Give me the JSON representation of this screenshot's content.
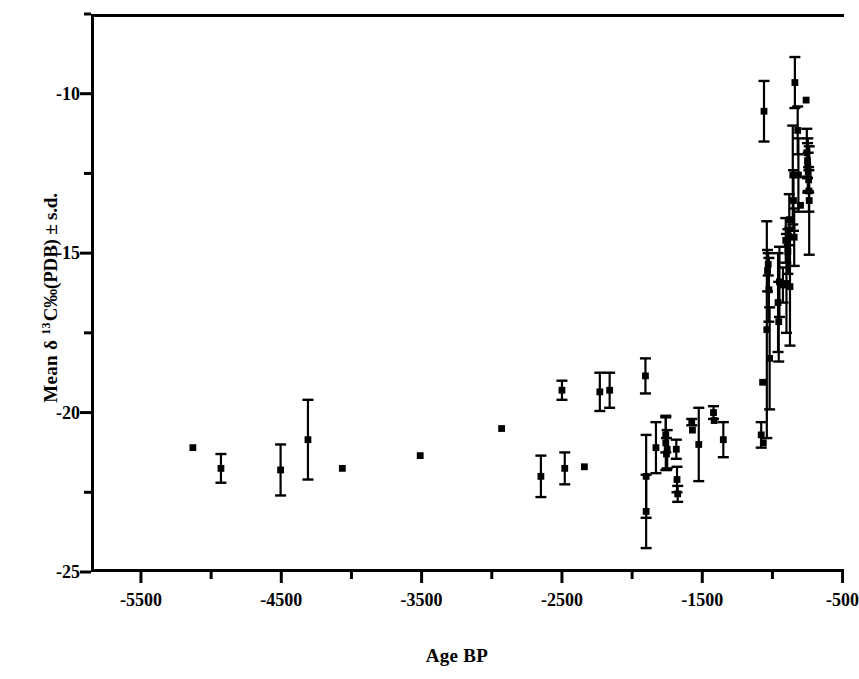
{
  "chart_data": {
    "type": "scatter",
    "title": "",
    "xlabel": "Age BP",
    "ylabel": "Mean δ 13C‰(PDB) ± s.d.",
    "ylabel_parts": {
      "prefix": "Mean δ ",
      "superscript": "13",
      "suffix": "C‰(PDB) ± s.d."
    },
    "xlim": [
      -5856,
      -490
    ],
    "ylim": [
      -25,
      -7.5
    ],
    "grid": false,
    "legend": null,
    "marker": "filled-square",
    "errorbars": "vertical ± s.d. with end caps",
    "color": "#000000",
    "xticks_major": [
      -5500,
      -4500,
      -3500,
      -2500,
      -1500,
      -500
    ],
    "xticks_major_labels": [
      "-5500",
      "-4500",
      "-3500",
      "-2500",
      "-1500",
      "-500"
    ],
    "xticks_minor": [
      -5000,
      -4000,
      -3000,
      -2000,
      -1000
    ],
    "yticks_major": [
      -10,
      -15,
      -20,
      -25
    ],
    "yticks_major_labels": [
      "-10",
      "-15",
      "-20",
      "-25"
    ],
    "yticks_minor": [
      -7.5,
      -12.5,
      -17.5,
      -22.5
    ],
    "series": [
      {
        "name": "Mean d13C by age",
        "points": [
          {
            "x": -5130,
            "y": -21.1,
            "sd": 0.0
          },
          {
            "x": -4930,
            "y": -21.75,
            "sd": 0.45
          },
          {
            "x": -4505,
            "y": -21.8,
            "sd": 0.8
          },
          {
            "x": -4310,
            "y": -20.85,
            "sd": 1.25
          },
          {
            "x": -4065,
            "y": -21.75,
            "sd": 0.0
          },
          {
            "x": -3510,
            "y": -21.35,
            "sd": 0.0
          },
          {
            "x": -2930,
            "y": -20.5,
            "sd": 0.0
          },
          {
            "x": -2650,
            "y": -22.0,
            "sd": 0.65
          },
          {
            "x": -2500,
            "y": -19.3,
            "sd": 0.3
          },
          {
            "x": -2480,
            "y": -21.75,
            "sd": 0.5
          },
          {
            "x": -2340,
            "y": -21.7,
            "sd": 0.0
          },
          {
            "x": -2230,
            "y": -19.35,
            "sd": 0.6
          },
          {
            "x": -2160,
            "y": -19.3,
            "sd": 0.55
          },
          {
            "x": -1905,
            "y": -18.85,
            "sd": 0.55
          },
          {
            "x": -1900,
            "y": -22.0,
            "sd": 1.3
          },
          {
            "x": -1900,
            "y": -23.1,
            "sd": 1.15
          },
          {
            "x": -1830,
            "y": -21.1,
            "sd": 0.8
          },
          {
            "x": -1760,
            "y": -20.95,
            "sd": 0.85
          },
          {
            "x": -1760,
            "y": -20.7,
            "sd": 0.55
          },
          {
            "x": -1755,
            "y": -21.3,
            "sd": 0.5
          },
          {
            "x": -1750,
            "y": -21.15,
            "sd": 0.6
          },
          {
            "x": -1685,
            "y": -21.15,
            "sd": 0.3
          },
          {
            "x": -1680,
            "y": -22.1,
            "sd": 0.4
          },
          {
            "x": -1675,
            "y": -22.55,
            "sd": 0.25
          },
          {
            "x": -1575,
            "y": -20.3,
            "sd": 0.1
          },
          {
            "x": -1570,
            "y": -20.55,
            "sd": 0.0
          },
          {
            "x": -1525,
            "y": -21.0,
            "sd": 1.15
          },
          {
            "x": -1420,
            "y": -20.0,
            "sd": 0.2
          },
          {
            "x": -1415,
            "y": -20.25,
            "sd": 0.0
          },
          {
            "x": -1350,
            "y": -20.85,
            "sd": 0.55
          },
          {
            "x": -1080,
            "y": -20.7,
            "sd": 0.4
          },
          {
            "x": -1070,
            "y": -19.05,
            "sd": 0.0
          },
          {
            "x": -1065,
            "y": -20.95,
            "sd": 0.0
          },
          {
            "x": -1060,
            "y": -10.55,
            "sd": 0.95
          },
          {
            "x": -1040,
            "y": -17.4,
            "sd": 3.4
          },
          {
            "x": -1035,
            "y": -15.55,
            "sd": 0.65
          },
          {
            "x": -1030,
            "y": -15.35,
            "sd": 0.35
          },
          {
            "x": -1025,
            "y": -16.15,
            "sd": 1.0
          },
          {
            "x": -1020,
            "y": -18.3,
            "sd": 1.6
          },
          {
            "x": -960,
            "y": -16.55,
            "sd": 1.55
          },
          {
            "x": -955,
            "y": -17.15,
            "sd": 1.25
          },
          {
            "x": -950,
            "y": -15.9,
            "sd": 1.1
          },
          {
            "x": -925,
            "y": -16.0,
            "sd": 0.55
          },
          {
            "x": -905,
            "y": -14.6,
            "sd": 0.7
          },
          {
            "x": -900,
            "y": -15.95,
            "sd": 1.55
          },
          {
            "x": -890,
            "y": -14.95,
            "sd": 0.7
          },
          {
            "x": -880,
            "y": -13.95,
            "sd": 0.8
          },
          {
            "x": -875,
            "y": -16.05,
            "sd": 1.85
          },
          {
            "x": -855,
            "y": -12.55,
            "sd": 1.55
          },
          {
            "x": -850,
            "y": -13.35,
            "sd": 0.95
          },
          {
            "x": -845,
            "y": -14.5,
            "sd": 0.9
          },
          {
            "x": -840,
            "y": -9.65,
            "sd": 0.8
          },
          {
            "x": -820,
            "y": -11.15,
            "sd": 0.75
          },
          {
            "x": -815,
            "y": -12.55,
            "sd": 1.15
          },
          {
            "x": -800,
            "y": -13.5,
            "sd": 0.0
          },
          {
            "x": -760,
            "y": -10.2,
            "sd": 0.0
          },
          {
            "x": -755,
            "y": -11.85,
            "sd": 0.75
          },
          {
            "x": -750,
            "y": -12.1,
            "sd": 0.55
          },
          {
            "x": -748,
            "y": -12.25,
            "sd": 0.85
          },
          {
            "x": -745,
            "y": -12.45,
            "sd": 0.6
          },
          {
            "x": -742,
            "y": -12.7,
            "sd": 0.4
          },
          {
            "x": -740,
            "y": -13.05,
            "sd": 0.65
          },
          {
            "x": -738,
            "y": -13.35,
            "sd": 1.7
          }
        ]
      }
    ]
  },
  "axes": {
    "x_title": "Age BP",
    "y_title_prefix": "Mean δ ",
    "y_title_sup": "13",
    "y_title_suffix": "C‰(PDB) ± s.d."
  }
}
